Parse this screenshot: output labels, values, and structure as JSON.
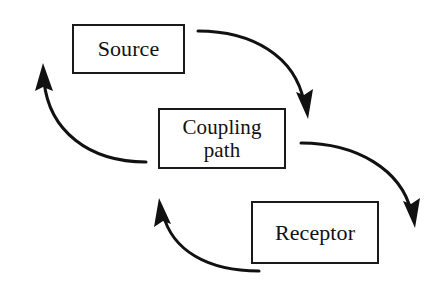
{
  "diagram": {
    "background_color": "#ffffff",
    "line_color": "#111111",
    "text_color": "#111111",
    "nodes": [
      {
        "id": "source",
        "label": "Source",
        "x": 72,
        "y": 24,
        "width": 113,
        "height": 50
      },
      {
        "id": "coupling",
        "label": "Coupling\npath",
        "x": 158,
        "y": 108,
        "width": 128,
        "height": 61
      },
      {
        "id": "receptor",
        "label": "Receptor",
        "x": 251,
        "y": 201,
        "width": 128,
        "height": 63
      }
    ],
    "edges": [
      {
        "id": "source-to-coupling",
        "from": "source",
        "to": "coupling",
        "direction": "down-right",
        "arrowhead": "filled-triangle"
      },
      {
        "id": "coupling-to-receptor",
        "from": "coupling",
        "to": "receptor",
        "direction": "down-right",
        "arrowhead": "filled-triangle"
      },
      {
        "id": "receptor-to-coupling",
        "from": "receptor",
        "to": "coupling",
        "direction": "up-left",
        "arrowhead": "filled-triangle"
      },
      {
        "id": "coupling-to-source",
        "from": "coupling",
        "to": "source",
        "direction": "up-left",
        "arrowhead": "filled-triangle"
      }
    ]
  }
}
